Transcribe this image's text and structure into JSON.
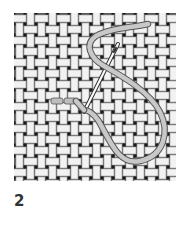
{
  "figure": {
    "label": "2"
  },
  "canvas": {
    "x": 14,
    "y": 13,
    "width": 162,
    "height": 168,
    "cell": 11,
    "colors": {
      "thread_light": "#f2f2f2",
      "thread_outline": "#9a9a9a",
      "hole": "#1a1a1a",
      "gap": "#5a5a5a"
    }
  },
  "stitch": {
    "thread_color": "#c8c8c8",
    "thread_outline": "#6e6e6e",
    "needle_color": "#ffffff",
    "needle_outline": "#444444",
    "completed_stitches": 2
  }
}
